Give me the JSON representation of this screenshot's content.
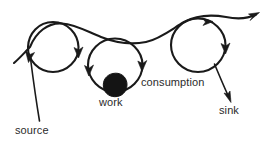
{
  "diagram": {
    "background_color": "#ffffff",
    "ink_color": "#1a1a1a",
    "labels": {
      "source": "source",
      "work": "work",
      "consumption": "consumption",
      "sink": "sink"
    },
    "nodes": [
      {
        "name": "loop-circle-1",
        "shape": "circle",
        "cx": 53,
        "cy": 47,
        "r": 25
      },
      {
        "name": "loop-circle-2",
        "shape": "circle",
        "cx": 115,
        "cy": 65,
        "r": 27
      },
      {
        "name": "loop-circle-3",
        "shape": "circle",
        "cx": 198,
        "cy": 45,
        "r": 27
      },
      {
        "name": "work-blob",
        "shape": "filled-circle",
        "cx": 115,
        "cy": 85,
        "r": 12
      }
    ],
    "flow": {
      "name": "main-flow-path",
      "description": "curved line entering lower-left, looping through three circles, exiting upper-right with arrowhead",
      "entry_point": [
        14,
        63
      ],
      "exit_point": [
        259,
        14
      ]
    },
    "arrow_markers": [
      {
        "name": "arrow-on-circle-1-left",
        "x": 30,
        "y": 57,
        "direction": "down-left"
      },
      {
        "name": "arrow-on-circle-1-right",
        "x": 78,
        "y": 53,
        "direction": "down"
      },
      {
        "name": "arrow-on-circle-2-left",
        "x": 90,
        "y": 70,
        "direction": "down"
      },
      {
        "name": "arrow-on-circle-2-right",
        "x": 142,
        "y": 65,
        "direction": "down"
      },
      {
        "name": "arrow-on-circle-3-top",
        "x": 208,
        "y": 20,
        "direction": "right"
      },
      {
        "name": "arrow-on-circle-3-right",
        "x": 225,
        "y": 48,
        "direction": "down"
      },
      {
        "name": "arrow-main-exit",
        "x": 259,
        "y": 14,
        "direction": "up-right"
      },
      {
        "name": "arrow-sink",
        "x": 229,
        "y": 99,
        "direction": "down-right"
      }
    ],
    "leaders": [
      {
        "name": "source-leader-line",
        "from": [
          31,
          58
        ],
        "to": [
          39,
          121
        ]
      },
      {
        "name": "sink-leader-line",
        "from": [
          216,
          66
        ],
        "to": [
          229,
          99
        ]
      }
    ]
  }
}
